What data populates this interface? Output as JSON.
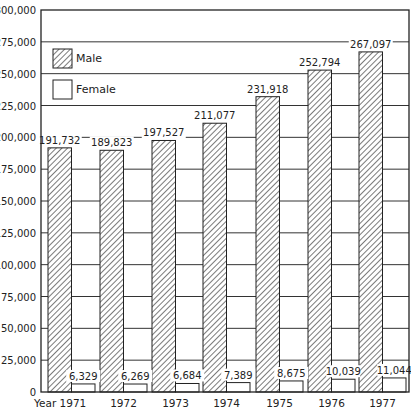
{
  "chart_data": {
    "type": "bar",
    "title": "",
    "xlabel": "Year",
    "ylabel": "",
    "ylim": [
      0,
      300000
    ],
    "grid": true,
    "legend_position": "upper-left-inside",
    "categories": [
      "1971",
      "1972",
      "1973",
      "1974",
      "1975",
      "1976",
      "1977"
    ],
    "x_tick_labels": [
      "Year 1971",
      "1972",
      "1973",
      "1974",
      "1975",
      "1976",
      "1977"
    ],
    "y_ticks": [
      0,
      25000,
      50000,
      75000,
      100000,
      125000,
      150000,
      175000,
      200000,
      225000,
      250000,
      275000,
      300000
    ],
    "y_tick_labels": [
      "0",
      "25,000",
      "50,000",
      "75,000",
      "100,000",
      "125,000",
      "150,000",
      "175,000",
      "200,000",
      "225,000",
      "250,000",
      "275,000",
      "300,000"
    ],
    "series": [
      {
        "name": "Male",
        "pattern": "diagonal-hatch",
        "values": [
          191732,
          189823,
          197527,
          211077,
          231918,
          252794,
          267097
        ],
        "labels": [
          "191,732",
          "189,823",
          "197,527",
          "211,077",
          "231,918",
          "252,794",
          "267,097"
        ]
      },
      {
        "name": "Female",
        "pattern": "none",
        "values": [
          6329,
          6269,
          6684,
          7389,
          8675,
          10039,
          11044
        ],
        "labels": [
          "6,329",
          "6,269",
          "6,684",
          "7,389",
          "8,675",
          "10,039",
          "11,044"
        ]
      }
    ]
  },
  "legend": {
    "male_label": "Male",
    "female_label": "Female"
  },
  "colors": {
    "ink": "#222222",
    "background": "#ffffff",
    "grid": "#333333"
  }
}
